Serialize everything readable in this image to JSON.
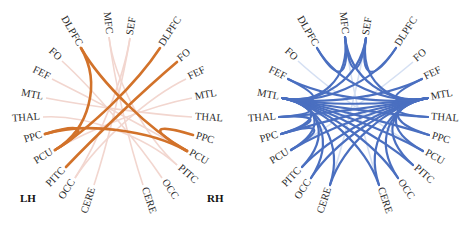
{
  "panels": [
    {
      "id": "left",
      "edge_color": "#d2722a",
      "faint_color": "#f2d6cf",
      "hemisphere_labels": {
        "left": "LH",
        "right": "RH"
      },
      "nodes": [
        {
          "id": "DLPFC_L",
          "label": "DLPFC",
          "x": 81,
          "y": 48,
          "angle": -55
        },
        {
          "id": "MFC",
          "label": "MFC",
          "x": 109,
          "y": 37,
          "angle": -78
        },
        {
          "id": "SEF",
          "label": "SEF",
          "x": 130,
          "y": 38,
          "angle": -80
        },
        {
          "id": "DLPFC_R",
          "label": "DLPFC",
          "x": 160,
          "y": 48,
          "angle": -55
        },
        {
          "id": "FO_R",
          "label": "FO",
          "x": 177,
          "y": 62,
          "angle": -42
        },
        {
          "id": "FEF_R",
          "label": "FEF",
          "x": 186,
          "y": 79,
          "angle": -28
        },
        {
          "id": "MTL_R",
          "label": "MTL",
          "x": 192,
          "y": 98,
          "angle": -14
        },
        {
          "id": "THAL_R",
          "label": "THAL",
          "x": 192,
          "y": 117,
          "angle": 0
        },
        {
          "id": "PPC_R",
          "label": "PPC",
          "x": 193,
          "y": 135,
          "angle": 16
        },
        {
          "id": "PCU_R",
          "label": "PCU",
          "x": 187,
          "y": 151,
          "angle": 32
        },
        {
          "id": "PITC_R",
          "label": "PITC",
          "x": 177,
          "y": 165,
          "angle": 48
        },
        {
          "id": "OCC_R",
          "label": "OCC",
          "x": 162,
          "y": 178,
          "angle": 62
        },
        {
          "id": "CERE_R",
          "label": "CERE",
          "x": 143,
          "y": 185,
          "angle": 78
        },
        {
          "id": "CERE_L",
          "label": "CERE",
          "x": 94,
          "y": 185,
          "angle": -78
        },
        {
          "id": "OCC_L",
          "label": "OCC",
          "x": 75,
          "y": 178,
          "angle": -62
        },
        {
          "id": "PITC_L",
          "label": "PITC",
          "x": 66,
          "y": 167,
          "angle": -48
        },
        {
          "id": "PCU_L",
          "label": "PCU",
          "x": 55,
          "y": 150,
          "angle": -32
        },
        {
          "id": "PPC_L",
          "label": "PPC",
          "x": 45,
          "y": 134,
          "angle": -16
        },
        {
          "id": "THAL_L",
          "label": "THAL",
          "x": 43,
          "y": 117,
          "angle": 0
        },
        {
          "id": "MTL_L",
          "label": "MTL",
          "x": 46,
          "y": 98,
          "angle": 14
        },
        {
          "id": "FEF_L",
          "label": "FEF",
          "x": 52,
          "y": 79,
          "angle": 28
        },
        {
          "id": "FO_L",
          "label": "FO",
          "x": 62,
          "y": 61,
          "angle": 42
        }
      ],
      "strong_edges": [
        [
          "DLPFC_L",
          "PCU_L"
        ],
        [
          "DLPFC_L",
          "PCU_R"
        ],
        [
          "DLPFC_R",
          "PCU_L"
        ],
        [
          "FO_R",
          "PITC_L"
        ],
        [
          "PPC_L",
          "PCU_R"
        ],
        [
          "PPC_L",
          "PCU_L"
        ],
        [
          "PPC_R",
          "PCU_R"
        ]
      ],
      "faint_edges": [
        [
          "FEF_L",
          "PCU_R"
        ],
        [
          "MTL_L",
          "THAL_R"
        ],
        [
          "MFC",
          "PITC_R"
        ],
        [
          "SEF",
          "CERE_L"
        ],
        [
          "FEF_R",
          "OCC_L"
        ],
        [
          "MTL_R",
          "PCU_L"
        ],
        [
          "THAL_L",
          "PITC_R"
        ],
        [
          "FO_L",
          "OCC_R"
        ],
        [
          "MFC",
          "CERE_R"
        ],
        [
          "SEF",
          "OCC_L"
        ]
      ]
    },
    {
      "id": "right",
      "edge_color": "#4a6fc0",
      "faint_color": "#d5e0f3",
      "hemisphere_labels": {
        "left": "",
        "right": ""
      },
      "offset_x": 236,
      "strong_edges": [
        [
          "MTL_L",
          "MTL_R"
        ],
        [
          "MTL_L",
          "THAL_R"
        ],
        [
          "MTL_L",
          "PPC_R"
        ],
        [
          "MTL_L",
          "PCU_R"
        ],
        [
          "MTL_L",
          "FEF_R"
        ],
        [
          "MTL_L",
          "PITC_R"
        ],
        [
          "MTL_L",
          "OCC_R"
        ],
        [
          "MTL_L",
          "DLPFC_R"
        ],
        [
          "MTL_L",
          "MFC"
        ],
        [
          "MTL_L",
          "SEF"
        ],
        [
          "MTL_L",
          "THAL_L"
        ],
        [
          "MTL_L",
          "PPC_L"
        ],
        [
          "MTL_L",
          "PCU_L"
        ],
        [
          "MTL_L",
          "PITC_L"
        ],
        [
          "MTL_L",
          "OCC_L"
        ],
        [
          "MTL_L",
          "CERE_L"
        ],
        [
          "MTL_L",
          "CERE_R"
        ],
        [
          "MTL_R",
          "THAL_L"
        ],
        [
          "MTL_R",
          "PPC_L"
        ],
        [
          "MTL_R",
          "PCU_L"
        ],
        [
          "MTL_R",
          "FEF_L"
        ],
        [
          "MTL_R",
          "DLPFC_L"
        ],
        [
          "MTL_R",
          "PITC_L"
        ],
        [
          "MTL_R",
          "OCC_L"
        ],
        [
          "MTL_R",
          "MFC"
        ],
        [
          "MTL_R",
          "SEF"
        ],
        [
          "MTL_R",
          "FEF_R"
        ],
        [
          "MTL_R",
          "THAL_R"
        ],
        [
          "MTL_R",
          "PPC_R"
        ],
        [
          "MTL_R",
          "PCU_R"
        ],
        [
          "MTL_R",
          "PITC_R"
        ],
        [
          "MTL_R",
          "CERE_L"
        ],
        [
          "MTL_R",
          "CERE_R"
        ],
        [
          "MTL_R",
          "OCC_R"
        ],
        [
          "DLPFC_L",
          "MFC"
        ],
        [
          "MFC",
          "SEF"
        ],
        [
          "SEF",
          "DLPFC_R"
        ],
        [
          "FEF_L",
          "MTL_L"
        ],
        [
          "THAL_L",
          "PPC_L"
        ],
        [
          "PPC_L",
          "PCU_L"
        ]
      ],
      "faint_edges": [
        [
          "FO_L",
          "PCU_R"
        ],
        [
          "FO_R",
          "PCU_L"
        ],
        [
          "MFC",
          "CERE_R"
        ],
        [
          "SEF",
          "CERE_L"
        ],
        [
          "THAL_L",
          "THAL_R"
        ]
      ]
    }
  ]
}
